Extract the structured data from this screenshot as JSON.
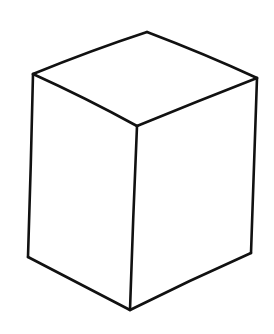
{
  "figure": {
    "background_color": "#ffffff",
    "stroke_color": "#111111",
    "vertices": {
      "top_back": [
        147,
        32
      ],
      "top_left": [
        33,
        74
      ],
      "top_right": [
        257,
        78
      ],
      "front_top": [
        137,
        126
      ],
      "bottom_left": [
        28,
        257
      ],
      "bottom_right": [
        251,
        253
      ],
      "bottom_front": [
        130,
        310
      ]
    },
    "edges": [
      {
        "name": "top-back-left-edge",
        "d": "M147,32 Q 92,50 33,74"
      },
      {
        "name": "top-back-right-edge",
        "d": "M147,32 Q 205,54 257,78"
      },
      {
        "name": "top-front-left-edge",
        "d": "M33,74 Q 86,98 137,126"
      },
      {
        "name": "top-front-right-edge",
        "d": "M137,126 Q 198,101 257,78"
      },
      {
        "name": "left-vertical-edge",
        "d": "M33,74 Q 31,165 28,257"
      },
      {
        "name": "front-vertical-edge",
        "d": "M137,126 Q 133,218 130,310"
      },
      {
        "name": "right-vertical-edge",
        "d": "M257,78 Q 254,166 251,253"
      },
      {
        "name": "bottom-left-edge",
        "d": "M28,257 Q 78,283 130,310"
      },
      {
        "name": "bottom-right-edge",
        "d": "M130,310 Q 190,280 251,253"
      }
    ]
  }
}
